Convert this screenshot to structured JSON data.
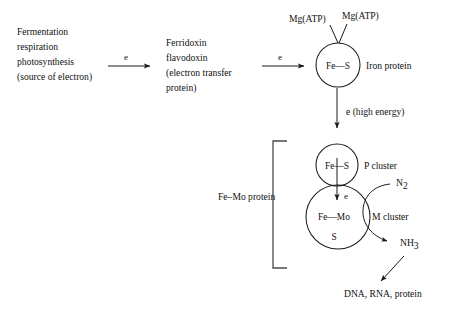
{
  "diagram": {
    "background_color": "#ffffff",
    "line_color": "#1a1a1a",
    "bracket_color": "#4a4a4a",
    "source": {
      "line1": "Fermentation",
      "line2": "respiration",
      "line3": "photosynthesis",
      "line4": "(source of electron)"
    },
    "carrier": {
      "line1": "Ferridoxin",
      "line2": "flavodoxin",
      "line3": "(electron transfer",
      "line4": "protein)"
    },
    "arrow1_label": "e",
    "arrow2_label": "e",
    "iron_protein": {
      "node_text": "Fe—S",
      "label": "Iron protein",
      "cofactor_left": "Mg(ATP)",
      "cofactor_right": "Mg(ATP)"
    },
    "high_energy_label": "e (high energy)",
    "fe_mo_protein_label": "Fe–Mo protein",
    "p_cluster": {
      "node_text": "Fe—S",
      "label": "P cluster"
    },
    "internal_electron_label": "e",
    "m_cluster": {
      "node_text_line1": "Fe—Mo",
      "node_text_line2": "S",
      "label": "M cluster"
    },
    "substrate": "N",
    "substrate_sub": "2",
    "product": "NH",
    "product_sub": "3",
    "final_products": "DNA, RNA, protein"
  }
}
